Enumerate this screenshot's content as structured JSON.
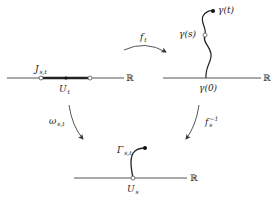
{
  "diagram": {
    "type": "commutative-mapping-diagram",
    "colors": {
      "stroke": "#333333",
      "background": "#ffffff"
    },
    "panels": {
      "top_left": {
        "axis_label": "ℝ",
        "interval_label_main": "J",
        "interval_label_sub": "s,t",
        "point_label_main": "U",
        "point_label_sub": "t"
      },
      "top_right": {
        "axis_label": "ℝ",
        "curve_end_label": "γ(t)",
        "curve_mid_label": "γ(s)",
        "curve_start_label": "γ(0)"
      },
      "bottom": {
        "axis_label": "ℝ",
        "curve_label_main": "Γ",
        "curve_label_sub": "s,t",
        "point_label_main": "U",
        "point_label_sub": "s"
      }
    },
    "arrows": {
      "top": {
        "label_main": "f",
        "label_sub": "t"
      },
      "left": {
        "label_main": "ω",
        "label_sub": "s,t"
      },
      "right": {
        "label_main": "f",
        "label_sub": "s",
        "label_sup": "−1"
      }
    }
  }
}
